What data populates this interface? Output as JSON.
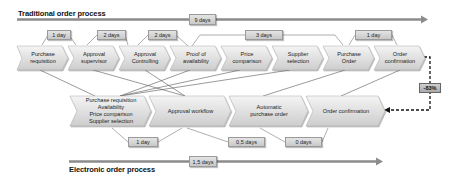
{
  "traditional": {
    "title": "Traditional order process",
    "total_duration": "9 days",
    "steps": [
      {
        "label": "Purchase\nrequisition"
      },
      {
        "label": "Approval\nsupervisor"
      },
      {
        "label": "Approval\nControlling"
      },
      {
        "label": "Proof of\navailability"
      },
      {
        "label": "Price\ncomparison"
      },
      {
        "label": "Supplier\nselection"
      },
      {
        "label": "Purchase\nOrder"
      },
      {
        "label": "Order\nconfirmation"
      }
    ],
    "durations": [
      "1 day",
      "2 days",
      "2 days",
      "3 days",
      "1 day"
    ]
  },
  "electronic": {
    "title": "Electronic order process",
    "total_duration": "1,5 days",
    "steps": [
      {
        "label": "Purchase requisition\nAvailability\nPrice comparison\nSupplier selection"
      },
      {
        "label": "Approval workflow"
      },
      {
        "label": "Automatic\npurchase order"
      },
      {
        "label": "Order confirmation"
      }
    ],
    "durations": [
      "1 day",
      "0,5 days",
      "0 days"
    ]
  },
  "reduction": {
    "label": "-83%"
  },
  "colors": {
    "chevron_top": "#f2f2f2",
    "chevron_bottom": "#cfcfcf",
    "line": "#7f7f7f",
    "dashed": "#111111"
  }
}
